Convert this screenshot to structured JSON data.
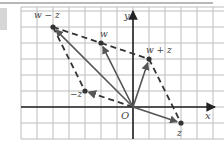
{
  "figure": {
    "axes": {
      "x_label": "x",
      "y_label": "y",
      "origin_label": "O"
    },
    "grid": {
      "x_min": -7,
      "x_max": 5,
      "y_min": -2,
      "y_max": 6,
      "cell_px": 16
    },
    "points": [
      {
        "id": "w_minus_z",
        "label": "w − z",
        "x": -5,
        "y": 5
      },
      {
        "id": "w",
        "label": "w",
        "x": -2,
        "y": 4
      },
      {
        "id": "w_plus_z",
        "label": "w + z",
        "x": 1,
        "y": 3
      },
      {
        "id": "neg_z",
        "label": "−z",
        "x": -3,
        "y": 1
      },
      {
        "id": "z",
        "label": "z",
        "x": 3,
        "y": -1
      }
    ],
    "vectors_solid": [
      "w_minus_z",
      "w",
      "w_plus_z",
      "z"
    ],
    "vectors_dashed": [
      "neg_z"
    ],
    "dashed_edges": [
      [
        "w_minus_z",
        "w"
      ],
      [
        "w",
        "w_plus_z"
      ],
      [
        "w_plus_z",
        "z"
      ],
      [
        "w_minus_z",
        "neg_z"
      ]
    ],
    "colors": {
      "grid": "#bdbdbd",
      "axis": "#333333",
      "vector": "#555555",
      "point": "#333333",
      "label": "#444444"
    }
  }
}
